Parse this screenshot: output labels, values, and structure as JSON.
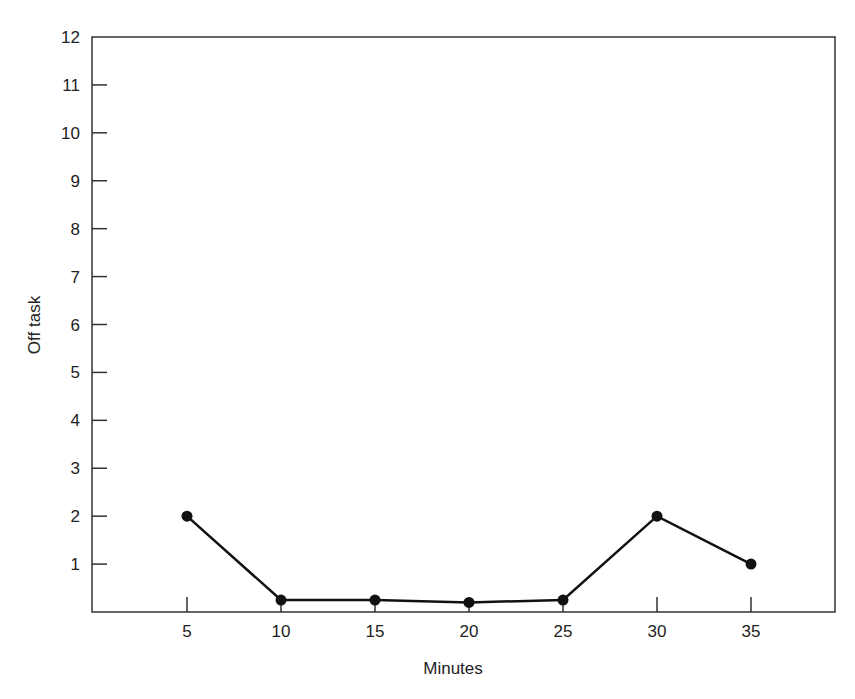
{
  "chart_data": {
    "type": "line",
    "title": "",
    "xlabel": "Minutes",
    "ylabel": "Off task",
    "x": [
      5,
      10,
      15,
      20,
      25,
      30,
      35
    ],
    "series": [
      {
        "name": "Off task",
        "values": [
          2,
          0.25,
          0.25,
          0.2,
          0.25,
          2,
          1
        ],
        "marker": "filled-circle",
        "color": "#111111"
      }
    ],
    "xticks": [
      5,
      10,
      15,
      20,
      25,
      30,
      35
    ],
    "yticks": [
      1,
      2,
      3,
      4,
      5,
      6,
      7,
      8,
      9,
      10,
      11,
      12
    ],
    "xlim": [
      0,
      39
    ],
    "ylim": [
      0,
      12
    ],
    "grid": false,
    "legend": null
  }
}
